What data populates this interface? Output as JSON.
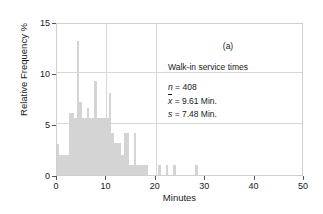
{
  "chart_data": {
    "type": "bar",
    "title": "",
    "xlabel": "Minutes",
    "ylabel": "Relative Frequency %",
    "xlim": [
      0,
      50
    ],
    "ylim": [
      0,
      15
    ],
    "xticks": [
      0,
      10,
      20,
      30,
      40,
      50
    ],
    "yticks": [
      0,
      5,
      10,
      15
    ],
    "grid": "light gridlines at x=10,20 and y=5,10",
    "legend": "none",
    "bar_color": "#d4d4d4",
    "bin_width": 0.5,
    "bins": [
      {
        "x": 0.0,
        "value": 3.0
      },
      {
        "x": 0.5,
        "value": 2.0
      },
      {
        "x": 1.0,
        "value": 2.0
      },
      {
        "x": 1.5,
        "value": 2.0
      },
      {
        "x": 2.0,
        "value": 2.0
      },
      {
        "x": 2.5,
        "value": 6.1
      },
      {
        "x": 3.0,
        "value": 6.1
      },
      {
        "x": 3.5,
        "value": 5.6
      },
      {
        "x": 4.0,
        "value": 13.1
      },
      {
        "x": 4.5,
        "value": 7.2
      },
      {
        "x": 5.0,
        "value": 5.6
      },
      {
        "x": 5.5,
        "value": 5.6
      },
      {
        "x": 6.0,
        "value": 6.6
      },
      {
        "x": 6.5,
        "value": 5.6
      },
      {
        "x": 7.0,
        "value": 5.6
      },
      {
        "x": 7.5,
        "value": 9.2
      },
      {
        "x": 8.0,
        "value": 5.6
      },
      {
        "x": 8.5,
        "value": 5.6
      },
      {
        "x": 9.0,
        "value": 5.6
      },
      {
        "x": 9.5,
        "value": 5.6
      },
      {
        "x": 10.0,
        "value": 5.6
      },
      {
        "x": 10.5,
        "value": 8.0
      },
      {
        "x": 11.0,
        "value": 4.1
      },
      {
        "x": 11.5,
        "value": 3.1
      },
      {
        "x": 12.0,
        "value": 3.1
      },
      {
        "x": 12.5,
        "value": 3.1
      },
      {
        "x": 13.0,
        "value": 2.0
      },
      {
        "x": 13.5,
        "value": 4.1
      },
      {
        "x": 14.0,
        "value": 4.1
      },
      {
        "x": 14.5,
        "value": 1.0
      },
      {
        "x": 15.0,
        "value": 1.0
      },
      {
        "x": 15.5,
        "value": 4.1
      },
      {
        "x": 16.0,
        "value": 1.0
      },
      {
        "x": 16.5,
        "value": 1.0
      },
      {
        "x": 17.0,
        "value": 1.0
      },
      {
        "x": 17.5,
        "value": 1.0
      },
      {
        "x": 18.0,
        "value": 1.0
      },
      {
        "x": 20.5,
        "value": 1.0
      },
      {
        "x": 22.0,
        "value": 1.0
      },
      {
        "x": 23.5,
        "value": 1.0
      },
      {
        "x": 28.0,
        "value": 1.0
      }
    ]
  },
  "axes": {
    "x": {
      "label": "Minutes",
      "ticklabels": [
        "0",
        "10",
        "20",
        "30",
        "40",
        "50"
      ]
    },
    "y": {
      "label": "Relative Frequency %",
      "ticklabels": [
        "0",
        "5",
        "10",
        "15"
      ]
    }
  },
  "annotation": {
    "panel_tag": "(a)",
    "caption": "Walk-in service times",
    "stats": [
      {
        "symbol": "n",
        "equals": "=",
        "value": "408"
      },
      {
        "symbol": "x",
        "equals": "=",
        "value": "9.61 Min."
      },
      {
        "symbol": "s",
        "equals": "=",
        "value": "7.48 Min."
      }
    ]
  }
}
